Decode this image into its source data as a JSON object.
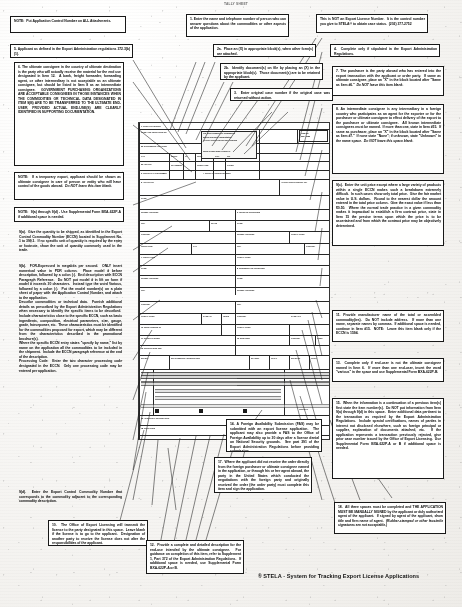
{
  "document": {
    "top_header": "TALLY SHEET",
    "footer_mark": "®",
    "footer_text": "STELA - System for Tracking Export License Applications"
  },
  "notes": [
    {
      "id": "note-attachments",
      "label": "NOTE: Put Application Control Number on ALL Attachments.",
      "html": "<b>NOTE:&nbsp; Put Application Control Number on ALL Attachments.</b>"
    },
    {
      "id": "note-5",
      "label": "5. Applicant as defined in the Export Administration regulations 372.3(b)(1).",
      "html": "<b>5. Applicant as defined in the Export Administration regulations 372.3(b)(1).</b>"
    },
    {
      "id": "note-6",
      "label": "6. The ultimate consignee in the country of ultimate destination is the party who will actually receive the material for the end use designated in Item 12. A bank, freight forwarder, forwarding agent, or other intermediary is not acceptable as an ultimate consignee, but should be listed in Item 8 as an intermediate consignee. GOVERNMENT PURCHASING ORGANIZATIONS ARE ACCEPTABLE CONSIGNEES IN THOSE INSTANCES WHEN THE COMMODITIES OR TECHNICAL DATA DESIGNATED IN ITEM 9(b) ARE TO BE TRANSFERRED TO THE ULTIMATE END-USER, PROVIDED ACTUAL END-USE(S) ARE CLEARLY IDENTIFIED IN SUPPORTING DOCUMENTATION.",
      "html": "<b>6. The ultimate consignee in the country of ultimate destination is the party who will actually receive the material for the end use designated in Item 12.&nbsp; A bank, freight forwarder, forwarding agent, or other intermediary is not acceptable as an ultimate consignee, but should be listed in Item 8 as an intermediate consignee.&nbsp; <span class='cap'>Government Purchasing Organizations are acceptable consignees in those instances when the commodities or technical data designated in item 9(b) are to be transferred to the ultimate end-user, provided actual end-use(s) are clearly identified in supporting documentation.</span></b>"
    },
    {
      "id": "note-6-temp",
      "label": "NOTE: If a temporary export, applicant should be shown as ultimate consignee in care of person or entity who will have control of the goods abroad. Do NOT leave this item blank.",
      "html": "<b>NOTE:&nbsp; If a temporary export, applicant should be shown as ultimate consignee in care of person or entity who will have control of the goods abroad.&nbsp; <i>Do NOT leave this item blank.</i></b>"
    },
    {
      "id": "note-9",
      "label": "NOTE: 9(a) through 9(d) - Use Supplemental Form BXA-622P-A if additional space is needed.",
      "html": "<b>NOTE:&nbsp; 9(a) through 9(d) - Use Supplemental Form BXA-622P-A if additional space is needed.</b>"
    },
    {
      "id": "note-9a",
      "label": "9(a). Give the quantity to be shipped, as identified in the Export Control Commodity Number (ECCN) located in Supplement No. 1 to 399.1. If no specific unit of quantity is required by the entry or footnote, show the unit of quantity commonly used in the trade.",
      "html": "<b>9(a).&nbsp; Give the quantity to be shipped, as identified in the Export Control Commodity Number (ECCN) located in Supplement No. 1 to 399.1.&nbsp; If no specific unit of quantity is required by the entry or footnote, show the unit of quantity commonly used in the trade.</b>"
    },
    {
      "id": "note-9b",
      "label": "9(b). FOR-E-pressed in megabits per second. ONLY insert numerical value in POR column. Place model # before description, followed by a colon (:). End description with ECCN Paragraph Reference. Do NOT put model # in lift on form if model # exceeds 30 characters. Instead type the word Various, followed by a colon (:). Put the model number(s) on a plain sheet of paper with the Application Control Number, and attach to the application. Describe commodities or technical data. Furnish additional details as prescribed by the Export Administration Regulations when necessary to identify the commodities to be described. Include characteristics close to the specific ECCN, such as basic ingredients, composition, electrical parameters, size, gauge, grade, horsepower, etc. These characteristics must be identified for the commodities proposed for export, which may be different from the characteristics described in the promotional brochure(s). Where the specific ECCN entry states \"specify by name,\" list by name on the application all the commodities to be included in the shipment. Include the ECCN paragraph reference at the end of the description. Processing Code: Enter the two character processing code designated in the ECCN. Only one processing code may be entered per application.",
      "html": "<b>9(b).&nbsp; FOR-Expressed in megabits per second.&nbsp; ONLY insert numerical value in PDR column.&nbsp; Place model # before description, followed by a colon (:).&nbsp; End description with ECCN Paragraph Reference.&nbsp; Do NOT put model # in lift on form if model # exceeds 30 characters.&nbsp; Instead type the word Various, followed by a colon (:).&nbsp; Put the model number(s) on a plain sheet of paper with the Application Control Number, and attach to the application.<br>Describe commodities or technical data.&nbsp; Furnish additional details as prescribed by the Export Administration Regulations when necessary to identify the specific items to be described.&nbsp; Include characteristics close to the specific ECCN, such as basic ingredients, composition, electrical parameters, size, gauge, grade, horsepower, etc.&nbsp; These characteristics must be identified for the commodities proposed for export, which may be different from the characteristics described in the promotional brochure(s).<br>Where the specific ECCN entry states \"specify by name,\" list by name on the application all the commodities to be included in the shipment.&nbsp; Include the ECCN paragraph reference at the end of the description.<br>Processing Code:&nbsp; Enter the two character processing code designated in the ECCN.&nbsp; Only one processing code may be entered per application.</b>"
    },
    {
      "id": "note-9d",
      "label": "9(d). Enter the Export Control Commodity Number that corresponds to the commodity adjacent to the corresponding commodity description.",
      "html": "<b>9(d).&nbsp; Enter the Export Control Commodity Number that corresponds to the commodity adjacent to the corresponding commodity description.</b>"
    },
    {
      "id": "note-10",
      "label": "10. The Office of Export Licensing will transmit the license to the party designated in this space. Leave blank if the license is to go to the applicant. Designation of another party to receive the license does not alter the responsibilities of the applicant.",
      "html": "<b>10.&nbsp; The Office of Export Licensing will transmit the license to the party designated in this space.&nbsp; Leave blank if the license is to go to the applicant.&nbsp; Designation of another party to receive the license does not alter the responsibilities of the applicant.</b>"
    },
    {
      "id": "note-1",
      "label": "1. Enter the name and telephone number of person who can answer questions about the commodities or other aspects of the application.",
      "html": "<b>1. Enter the name and telephone number of person who can answer questions about the commodities or other aspects of the application.</b>"
    },
    {
      "id": "note-2a",
      "label": "2a. Place an (X) in appropriate block(s), when other form(s) are attached.",
      "html": "<b>2a.&nbsp; Place an (X) in appropriate block(s), when other form(s) are attached.</b>"
    },
    {
      "id": "note-2b",
      "label": "2b. Identify document(s) on file by placing an (X) in the appropriate block(s). Those documents are to be retained by the applicant.",
      "html": "<b>2b.&nbsp; Identify document(s) on file by placing an (X) in the appropriate block(s).&nbsp; Those document(s) are to be retained by the applicant.</b>"
    },
    {
      "id": "note-3",
      "label": "3. Enter original case number if the original case was returned without action.",
      "html": "<b>3.&nbsp; Enter original case number if the original case was returned without action.</b>"
    },
    {
      "id": "note-control",
      "label": "This is NOT an Export License Number. It is the control number you give to STELA® to obtain case status. (202) 377-2752",
      "html": "<b>This is NOT an Export License Number.&nbsp; It is the control number you give to STELA&reg; to obtain case status.&nbsp; (202) 377-2752</b>"
    },
    {
      "id": "note-4",
      "label": "4. Complete only if stipulated in the Export Administration Regulations.",
      "html": "<b>4.&nbsp; Complete only if stipulated in the Export Administration Regulations.</b>"
    },
    {
      "id": "note-7",
      "label": "7. The purchaser is the party abroad who has entered into the export transaction with the applicant or order party. If same as ultimate consignee, place an \"X\" in the block located after \"Same as Item #6.\" Do NOT leave this item blank.",
      "html": "<b>7. The purchaser is the party abroad who has entered into the export transaction with the applicant or order party.&nbsp; If same as ultimate consignee, place an \"X\" in the block located after \"Same as Item #6.\"&nbsp; <i>Do NOT leave this item blank.</i></b>"
    },
    {
      "id": "note-8",
      "label": "8. An intermediate consignee is any intermediary in a foreign country who participates as an agent for the exporter or for the purchaser or ultimate consignee to effect delivery of the export to the purchaser or ultimate consignee. All known intermediate consignees must be named. If more than one, state in Item #15. If same as purchaser, place an \"X\" in the block located after \"Same as Item #7.\" If none state \"None\"; if unknown, state \"Unknown\" in the name space. Do NOT leave this space blank.",
      "html": "<b>8. An intermediate consignee is any intermediary in a foreign country who participates as an agent for the exporter or for the purchaser or ultimate consignee to effect delivery of the export to the purchaser or ultimate consignee.&nbsp; All known intermediate consignees must be named.&nbsp; If more than one, state in Item #15.&nbsp; If same as purchaser, place an \"X\" in the block located after \"Same as Item #7.\"&nbsp; If none state \"None\"; if unknown, state \"Unknown\" in the name space.&nbsp; <i>Do NOT leave this space blank.</i></b>"
    },
    {
      "id": "note-9c",
      "label": "9(c). Enter the unit price except where a large variety of products within a single ECCN makes such a breakdown extremely difficult. In such cases show only total price. Give the fair market value in U.S. dollars. Round to the nearest dollar the amount entered in the total price column. Give the exact value if less than $0.50. Where the normal trade practice in a given commodity makes it impractical to establish a firm contract price, state in Item 15 the precise terms upon which the price is to be ascertained and from which the contract price may be objectively determined.",
      "html": "<b>9(c).&nbsp; Enter the unit price except where a large variety of products within a single ECCN makes such a breakdown extremely difficult.&nbsp; In such cases show only total price.&nbsp; Give the fair market value in U.S. dollars.&nbsp; Round to the nearest dollar the amount entered in the total price column.&nbsp; Give the exact value if less than $0.50.&nbsp; Where the normal trade practice in a given commodity makes it impractical to establish a firm contract price, state in Item 15 the precise terms upon which the price is to be ascertained and from which the contract price may be objectively determined.</b>"
    },
    {
      "id": "note-11",
      "label": "11. Provide manufacturer name of the total or assembled commodity(ies). Do NOT include address. If more than one name, separate names by commas. If additional space is needed, continue in Item #15. NOTE: Leave this item blank only if the ECCN is 1594.",
      "html": "<b>11. Provide manufacturer name of the total or assembled commodity(ies).&nbsp; Do NOT include address.&nbsp; If more than one name, separate names by commas.&nbsp; If additional space is needed, continue in Item #15.&nbsp; NOTE:&nbsp; Leave this item blank only if the ECCN is 1594.</b>"
    },
    {
      "id": "note-13",
      "label": "13. Complete only if end-user is not the ultimate consignee named in Item 6. If more than one end-user, insert the word \"various\" in the space and use Supplemental Form BXA-622P-B.",
      "html": "<b>13.&nbsp; Complete only if end-user is not the ultimate consignee named in Item 6.&nbsp; If more than one end-user, insert the word \"various\" in the space and use Supplemental Form BXA-622P-B.</b>"
    },
    {
      "id": "note-15",
      "label": "15. When the information is a continuation of a previous item(s) first state the item number(s). Do NOT put information from Item 9(a) through 9(d) in this space. Enter additional data pertinent to the transaction as required by the Export Administration Regulations. Include special certifications, names of parties in interest not disclosed elsewhere, such as foreign principal or supplier, explanation of documents attached, etc. If the application represents a transaction previously rejected, give prior case number issued by the Office of Export Licensing. Use Supplemental Form BXA-622P-A or B if additional space is needed.",
      "html": "<b>15.&nbsp; When the information is a continuation of a previous item(s) first state the item number(s).&nbsp; Do NOT put information from Item 9(a) through 9(d) in this space.&nbsp; Enter additional data pertinent to the transaction as required by the Export Administration Regulations.&nbsp; Include special certifications, names of parties in interest not disclosed elsewhere, such as foreign principal or supplier, explanation of documents attached, etc.&nbsp; If the application represents a transaction previously rejected, give prior case number issued by the Office of Export Licensing.&nbsp; Use Supplemental Form BXA-622P-A or B if additional space is needed.</b>"
    },
    {
      "id": "note-18",
      "label": "18. All three spaces must be completed and THE APPLICATION MUST BE MANUALLY SIGNED by the applicant or duly authorized agent of the applicant. If signed by agent of the applicant, show title and firm name of agent. (Rubber-stamped or other facsimile signatures are not acceptable.)",
      "html": "<b>18.&nbsp; All three spaces must be completed and <span class='cap'>the application must be manually signed</span> by the applicant or duly authorized agent of the applicant.&nbsp; If signed by agent of the applicant, show title and firm name of agent.&nbsp; <i>(Rubber-stamped or other facsimile signatures are not acceptable.)</i></b>"
    },
    {
      "id": "note-14",
      "label": "14. A Foreign Availability Submission (FAS) may be submitted with an export license application. The applicant may also provide a FAS to the Office of Foreign Availability up to 30 days after a license denial on National Security grounds. See part 391 of the Export Administration Regulations before providing submission.",
      "html": "<b>14. A Foreign Availability Submission (FAS) may be submitted with an export license application.&nbsp; The applicant may also provide a FAS to the Office of Foreign Availability up to 30 days after a license denial on National Security grounds.&nbsp; See part 391 of the Export Administration Regulations before providing submission.</b>"
    },
    {
      "id": "note-17",
      "label": "17. Where the applicant did not receive the order directly from the foreign purchaser or ultimate consignee named in the application, or through his or her agent abroad, the party in the United States which conducted the negotiations with the foreign party and originally received the order (the order party) must complete this item and sign the application.",
      "html": "<b>17.&nbsp; Where the applicant did not receive the order directly from the foreign purchaser or ultimate consignee named in the application, or through his or her agent abroad, the party in the United States which conducted the negotiations with the foreign party and originally received the order (the order party) must complete this item and sign the application.</b>"
    },
    {
      "id": "note-12",
      "label": "12. Provide a complete and detailed description for the end-use intended by the ultimate consignee. For guidance on completion of this item, refer to Supplement 1, Part 372 of the Export Administration Regulations. If additional space is needed, use Supplemental Form BXA-622P-A or B.",
      "html": "<b>12.&nbsp; Provide a complete and detailed description for the end-use intended by the ultimate consignee.&nbsp; For guidance on completion of this item, refer to Supplement 1, Part 372 of the Export Administration Regulations.&nbsp; If additional space is needed, use Supplemental Form BXA-622P-A or B.</b>"
    }
  ],
  "form": {
    "title": "Export License Application BXA-622P",
    "field_labels": [
      "1. CONTACT PERSON",
      "TELEPHONE NO.",
      "2a. DOCUMENTS ATTACHED TO APPLICATION",
      "2b. DOCUMENTS ON FILE WITH APPLICANT",
      "3. ORIGINAL CASE NUMBER",
      "4. SPECIAL LICENSE",
      "APPLICATION CONTROL NUMBER",
      "5. APPLICANT",
      "6. ULTIMATE CONSIGNEE",
      "7. PURCHASER",
      "8. INTERMEDIATE CONSIGNEE",
      "NAME",
      "STREET ADDRESS",
      "CITY",
      "COUNTRY",
      "POSTAL CODE",
      "9(a) QUANTITY",
      "9(b) COMMODITY DESCRIPTION",
      "9(c) UNIT PRICE",
      "TOTAL PRICE",
      "9(d) ECCN",
      "10. SEND LICENSE TO",
      "11. MANUFACTURER",
      "12. SPECIFIC END-USE",
      "13. END-USER",
      "14. FOREIGN AVAILABILITY",
      "15. ADDITIONAL INFORMATION",
      "16. ULTIMATE CONSIGNEE STATEMENT",
      "17. ORDER PARTY",
      "18. SIGNATURE / TITLE / DATE"
    ]
  }
}
